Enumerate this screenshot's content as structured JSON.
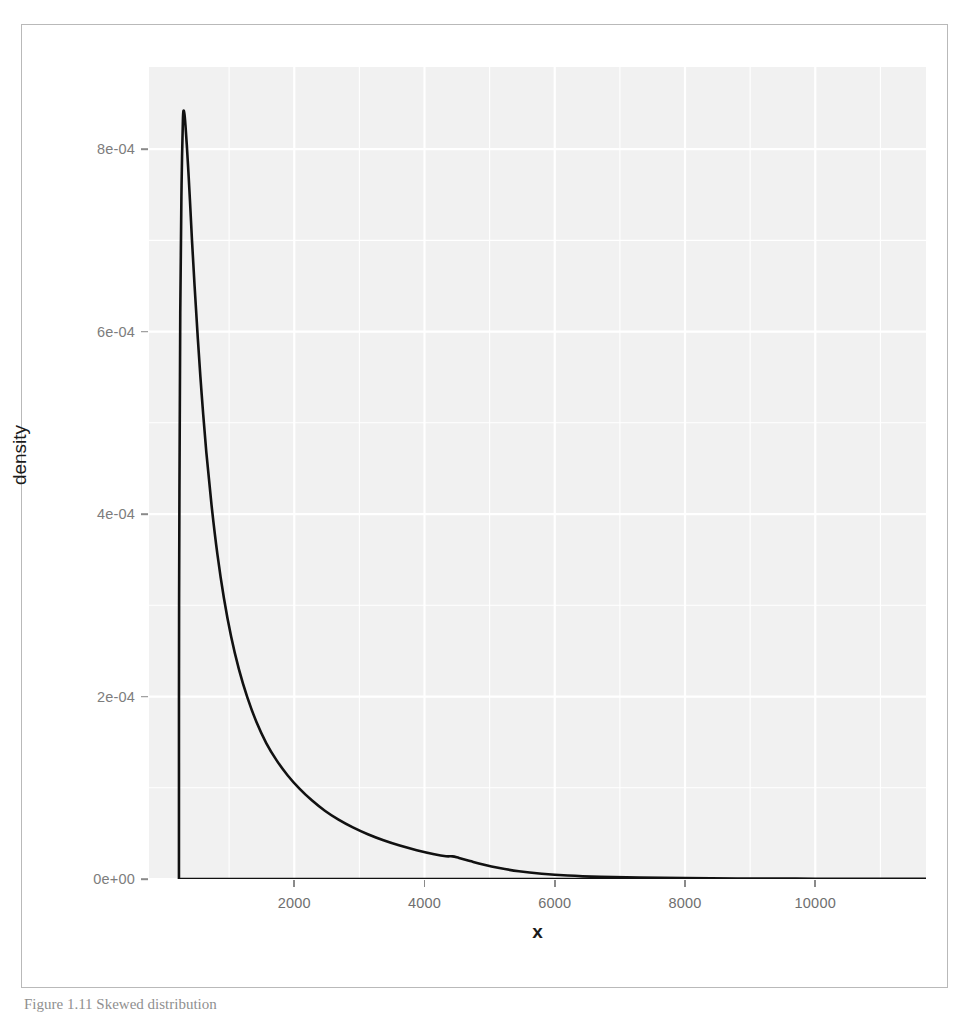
{
  "figure": {
    "caption": "Figure 1.11 Skewed distribution",
    "panel_background": "#f1f1f1",
    "grid_color": "#ffffff",
    "curve_color": "#111111",
    "frame_color": "#b9b9b9"
  },
  "chart_data": {
    "type": "line",
    "title": "",
    "subtitle": "",
    "xlabel": "x",
    "ylabel": "density",
    "grid": true,
    "legend": null,
    "xlim": [
      -230,
      11700
    ],
    "ylim": [
      0,
      0.00089
    ],
    "xticks": [
      2000,
      4000,
      6000,
      8000,
      10000
    ],
    "xticklabels": [
      "2000",
      "4000",
      "6000",
      "8000",
      "10000"
    ],
    "yticks": [
      0.0,
      0.0002,
      0.0004,
      0.0006,
      0.0008
    ],
    "yticklabels": [
      "0e+00",
      "2e-04",
      "4e-04",
      "6e-04",
      "8e-04"
    ],
    "x_minor_ticks": [
      1000,
      3000,
      5000,
      7000,
      9000,
      11000
    ],
    "y_minor_ticks": [
      0.0001,
      0.0003,
      0.0005,
      0.0007
    ],
    "series": [
      {
        "name": "density",
        "x": [
          230,
          232,
          250,
          270,
          290,
          300,
          315,
          330,
          350,
          375,
          400,
          430,
          470,
          520,
          580,
          650,
          730,
          820,
          920,
          1030,
          1150,
          1280,
          1420,
          1570,
          1730,
          1900,
          2080,
          2270,
          2470,
          2680,
          2900,
          3130,
          3370,
          3620,
          3880,
          4150,
          4330,
          4430,
          4530,
          4700,
          4900,
          5150,
          5450,
          5800,
          6200,
          6700,
          7300,
          8000,
          8800,
          9700,
          10600,
          11400,
          11700
        ],
        "y": [
          0.0,
          0.0003,
          0.00062,
          0.00076,
          0.00083,
          0.000842,
          0.000838,
          0.000826,
          0.000805,
          0.000775,
          0.000742,
          0.0007,
          0.00065,
          0.000592,
          0.00053,
          0.000468,
          0.00041,
          0.000356,
          0.000308,
          0.000266,
          0.00023,
          0.000199,
          0.000172,
          0.000149,
          0.00013,
          0.0001135,
          9.9e-05,
          8.62e-05,
          7.48e-05,
          6.5e-05,
          5.65e-05,
          4.9e-05,
          4.24e-05,
          3.66e-05,
          3.16e-05,
          2.72e-05,
          2.5e-05,
          2.48e-05,
          2.3e-05,
          1.96e-05,
          1.58e-05,
          1.2e-05,
          8.5e-06,
          5.8e-06,
          3.8e-06,
          2.4e-06,
          1.5e-06,
          1e-06,
          6e-07,
          4e-07,
          2e-07,
          1e-07,
          1e-07
        ]
      }
    ],
    "baseline": {
      "note": "density traced along y=0 from curve foot to right edge",
      "y": 0.0
    }
  }
}
